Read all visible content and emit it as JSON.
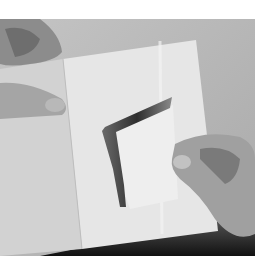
{
  "image": {
    "description": "Grayscale photo of two hands holding an open sheet of folded white paper with an L-shaped cut flap lifted",
    "colors": {
      "background": "#b9b9b9",
      "paper": "#e4e4e4",
      "paper_right": "#ececec",
      "shadow": "#1c1c1c",
      "skin": "#a8a8a8",
      "cut": "#4a4a4a"
    }
  }
}
